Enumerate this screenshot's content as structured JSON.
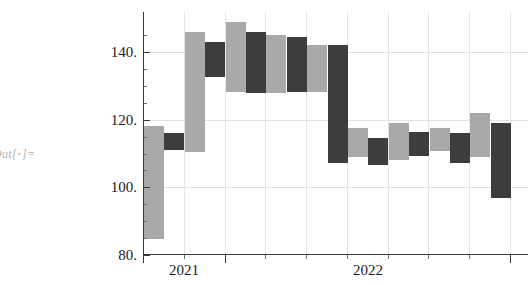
{
  "notebook": {
    "out_prompt_prefix": "Out[",
    "out_prompt_bullet": "•",
    "out_prompt_suffix": "]="
  },
  "colors": {
    "up_bar": "#a9a9a9",
    "down_bar": "#3d3d3d",
    "axis": "#3a3a3a",
    "gridline": "#e2e2e2",
    "label_text": "#1c1c1c",
    "prompt_text": "#b3b3b3",
    "background": "#ffffff"
  },
  "chart_data": {
    "type": "bar",
    "title": "",
    "subtitle": "",
    "xlabel": "",
    "ylabel": "",
    "legend": [],
    "grid": true,
    "ylim": [
      80,
      150
    ],
    "xlim": [
      2020.83,
      2023.0
    ],
    "y_ticks": [
      80,
      100,
      120,
      140
    ],
    "y_tick_labels": [
      "80.",
      "100.",
      "120.",
      "140."
    ],
    "x_ticks": [
      2021,
      2022
    ],
    "x_tick_labels": [
      "2021",
      "2022"
    ],
    "series": [
      {
        "name": "candles",
        "bars": [
          {
            "index": 1,
            "x_center": 2020.95,
            "high": 118.0,
            "low": 84.5,
            "direction": "up"
          },
          {
            "index": 2,
            "x_center": 2021.06,
            "high": 116.0,
            "low": 111.0,
            "direction": "down"
          },
          {
            "index": 3,
            "x_center": 2021.17,
            "high": 146.0,
            "low": 110.5,
            "direction": "up"
          },
          {
            "index": 4,
            "x_center": 2021.28,
            "high": 143.0,
            "low": 132.8,
            "direction": "down"
          },
          {
            "index": 5,
            "x_center": 2021.39,
            "high": 149.0,
            "low": 128.2,
            "direction": "up"
          },
          {
            "index": 6,
            "x_center": 2021.5,
            "high": 146.0,
            "low": 128.0,
            "direction": "down"
          },
          {
            "index": 7,
            "x_center": 2021.61,
            "high": 145.0,
            "low": 128.0,
            "direction": "up"
          },
          {
            "index": 8,
            "x_center": 2021.72,
            "high": 144.5,
            "low": 128.2,
            "direction": "down"
          },
          {
            "index": 9,
            "x_center": 2021.83,
            "high": 142.0,
            "low": 128.0,
            "direction": "up"
          },
          {
            "index": 10,
            "x_center": 2021.94,
            "high": 142.0,
            "low": 107.2,
            "direction": "down"
          },
          {
            "index": 11,
            "x_center": 2022.05,
            "high": 117.4,
            "low": 108.7,
            "direction": "up"
          },
          {
            "index": 12,
            "x_center": 2022.16,
            "high": 114.5,
            "low": 106.4,
            "direction": "down"
          },
          {
            "index": 13,
            "x_center": 2022.27,
            "high": 118.9,
            "low": 108.1,
            "direction": "up"
          },
          {
            "index": 14,
            "x_center": 2022.38,
            "high": 116.3,
            "low": 109.3,
            "direction": "down"
          },
          {
            "index": 15,
            "x_center": 2022.49,
            "high": 117.4,
            "low": 110.6,
            "direction": "up"
          },
          {
            "index": 16,
            "x_center": 2022.6,
            "high": 116.0,
            "low": 107.2,
            "direction": "down"
          },
          {
            "index": 17,
            "x_center": 2022.71,
            "high": 122.1,
            "low": 109.0,
            "direction": "up"
          },
          {
            "index": 18,
            "x_center": 2022.82,
            "high": 118.9,
            "low": 96.8,
            "direction": "down"
          }
        ]
      }
    ]
  },
  "geometry": {
    "plot_left_px": 143,
    "plot_top_px": 12,
    "plot_width_px": 385,
    "plot_height_px": 243,
    "y_pixel_for_140": 40,
    "y_pixel_for_80": 243,
    "bar_start_px": 1,
    "bar_width_px": 20,
    "bar_pitch_px": 20.4,
    "v_gridlines_px": [
      41,
      82,
      122,
      163,
      204,
      245,
      285,
      326,
      367
    ],
    "h_gridlines_value": [
      100,
      120,
      140
    ],
    "x_major_ticks_px": [
      0,
      82,
      367
    ],
    "x_minor_ticks_px": [
      41,
      122,
      163,
      204,
      245,
      285,
      326
    ],
    "y_minor_ticks_value": [
      85,
      90,
      95,
      105,
      110,
      115,
      125,
      130,
      135,
      145
    ],
    "x_label_px": [
      41,
      225
    ]
  }
}
